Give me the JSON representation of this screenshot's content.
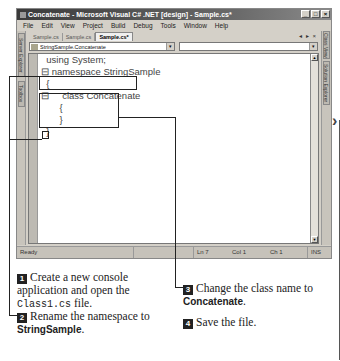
{
  "window": {
    "title": "Concatenate - Microsoft Visual C# .NET [design] - Sample.cs*",
    "controls": [
      "_",
      "□",
      "×"
    ]
  },
  "menubar": [
    "File",
    "Edit",
    "View",
    "Project",
    "Build",
    "Debug",
    "Tools",
    "Window",
    "Help"
  ],
  "left_rail": {
    "tabs": [
      "Server Explorer",
      "Toolbox"
    ]
  },
  "right_rail": {
    "tabs": [
      "Class View",
      "Solution Explorer"
    ]
  },
  "tabs": [
    {
      "label": "Sample.cs",
      "active": false
    },
    {
      "label": "Sample.cs",
      "active": false
    },
    {
      "label": "Sample.cs*",
      "active": true
    }
  ],
  "tab_nav": "◂ ▸ ×",
  "combos": {
    "left": "StringSample.Concatenate",
    "right": ""
  },
  "code": {
    "lines": [
      "  using System;",
      "",
      "⊟ namespace StringSample",
      "  {",
      "⊟     class Concatenate",
      "       {",
      "",
      "       }",
      "  }"
    ]
  },
  "statusbar": {
    "ready": "Ready",
    "ln": "Ln 7",
    "col": "Col 1",
    "ch": "Ch 1",
    "ins": "INS"
  },
  "steps": [
    {
      "num": "1",
      "text_a": "Create a new console application and open the ",
      "code": "Class1.cs",
      "text_b": " file."
    },
    {
      "num": "2",
      "text_a": "Rename the namespace to ",
      "bold": "StringSample",
      "text_b": "."
    },
    {
      "num": "3",
      "text_a": "Change the class name to ",
      "bold": "Concatenate",
      "text_b": "."
    },
    {
      "num": "4",
      "text_a": "Save the file."
    }
  ]
}
